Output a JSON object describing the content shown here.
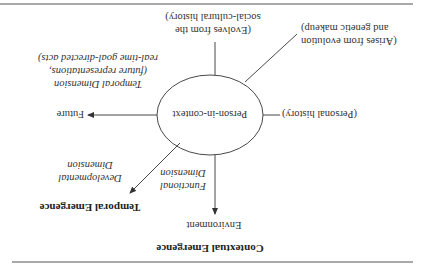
{
  "diagram": {
    "orientation": "rotated-180",
    "center": {
      "label": "Person-in-context"
    },
    "headings": {
      "contextual": "Contextual Emergence",
      "temporal": "Temporal Emergence"
    },
    "nodes": {
      "environment": "Environment",
      "future": "Future",
      "personal_history": "(Personal history)",
      "evolution": [
        "(Arises from evolution",
        "and genetic makeup)"
      ],
      "social": [
        "(Evolves from the",
        "social-cultural history)"
      ]
    },
    "dimensions": {
      "functional": [
        "Functional",
        "Dimension"
      ],
      "developmental": [
        "Developmental",
        "Dimension"
      ],
      "temporal": [
        "Temporal Dimension",
        "(future representations,",
        "real-time goal-directed acts)"
      ]
    },
    "colors": {
      "ink": "#333333",
      "rule": "#555555",
      "background": "#ffffff"
    }
  }
}
